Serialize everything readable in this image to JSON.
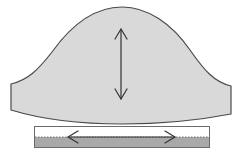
{
  "diagram": {
    "colors": {
      "background": "#ffffff",
      "shape_fill": "#d9d9d9",
      "shape_stroke": "#4a4a4a",
      "bar_top_fill": "#ffffff",
      "bar_bottom_fill": "#a9a9a9",
      "bar_stroke": "#6a6a6a",
      "arrow_stroke": "#333333",
      "dotted_line": "#888888"
    },
    "elements": [
      {
        "id": "bell-shape",
        "type": "shape",
        "label": ""
      },
      {
        "id": "vertical-arrow",
        "type": "double-arrow",
        "orientation": "vertical",
        "label": ""
      },
      {
        "id": "layer-bar",
        "type": "bar",
        "label": ""
      },
      {
        "id": "horizontal-arrow",
        "type": "double-arrow",
        "orientation": "horizontal",
        "label": ""
      }
    ]
  }
}
